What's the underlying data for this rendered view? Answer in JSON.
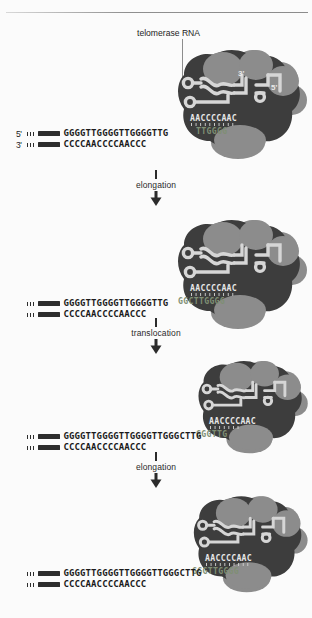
{
  "figure": {
    "title_callout": "telomerase RNA",
    "rna_template_seq": "AACCCCAAC",
    "rna_end_3": "3'",
    "rna_end_5": "5'",
    "strand_label_5": "5'",
    "strand_label_3": "3'"
  },
  "steps": [
    {
      "id": "step-elongation-1",
      "label": "elongation"
    },
    {
      "id": "step-translocation",
      "label": "translocation"
    },
    {
      "id": "step-elongation-2",
      "label": "elongation"
    }
  ],
  "panels": [
    {
      "id": "panel-1",
      "show_prime_labels": true,
      "top_strand": "GGGGTTGGGGTTGGGGTTG",
      "top_strand_hidden": "",
      "bottom_strand": "CCCCAACCCCAACCC",
      "enzyme_template_shadow": "TTGGGG"
    },
    {
      "id": "panel-2",
      "show_prime_labels": false,
      "top_strand": "GGGGTTGGGGTTGGGGTTG",
      "top_strand_hidden": "GGCTTGGGG",
      "bottom_strand": "CCCCAACCCCAACCC",
      "enzyme_template_shadow": "TTGGGG"
    },
    {
      "id": "panel-3",
      "show_prime_labels": false,
      "top_strand": "GGGGTTGGGGTTGGGGTTGGGCTTG",
      "top_strand_hidden": "GGGTTG",
      "bottom_strand": "CCCCAACCCCAACCC",
      "enzyme_template_shadow": "TTGGGG"
    },
    {
      "id": "panel-4",
      "show_prime_labels": false,
      "top_strand": "GGGGTTGGGGTTGGGGTTGGGCTTG",
      "top_strand_hidden": "GGGTTGGGG",
      "bottom_strand": "CCCCAACCCCAACCC",
      "enzyme_template_shadow": "TTGGGG"
    }
  ],
  "colors": {
    "enzyme_dark": "#3d3d3d",
    "enzyme_light": "#8c8c8c",
    "rna_strand": "#d6d6d6",
    "dna_black": "#2d2d2d",
    "background": "#fbfbfb",
    "rule": "#8f8f8f"
  }
}
